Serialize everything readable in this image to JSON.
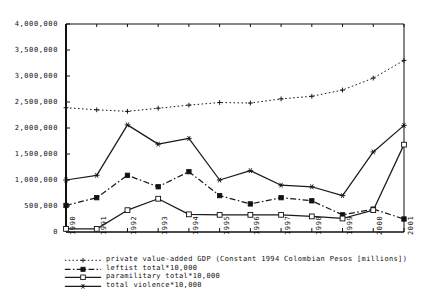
{
  "chart_data": {
    "type": "line",
    "title": "",
    "xlabel": "",
    "ylabel": "",
    "categories": [
      "1990",
      "1991",
      "1992",
      "1993",
      "1994",
      "1995",
      "1996",
      "1997",
      "1998",
      "1999",
      "2000",
      "2001"
    ],
    "ylim": [
      0,
      4000000
    ],
    "ytick_labels": [
      "0",
      "500,000",
      "1,000,000",
      "1,500,000",
      "2,000,000",
      "2,500,000",
      "3,000,000",
      "3,500,000",
      "4,000,000"
    ],
    "ytick_values": [
      0,
      500000,
      1000000,
      1500000,
      2000000,
      2500000,
      3000000,
      3500000,
      4000000
    ],
    "grid": false,
    "legend_position": "below",
    "series": [
      {
        "name": "private value-added GDP (Constant 1994 Colombian Pesos [millions])",
        "key": "gdp",
        "marker": "plus",
        "linestyle": "dotted",
        "color": "#1a1a1a",
        "values": [
          2390000,
          2350000,
          2320000,
          2380000,
          2440000,
          2490000,
          2480000,
          2560000,
          2610000,
          2730000,
          2960000,
          3300000
        ]
      },
      {
        "name": "leftist total*10,000",
        "key": "leftist",
        "marker": "filled-square",
        "linestyle": "dash-dot",
        "color": "#1a1a1a",
        "values": [
          510000,
          660000,
          1090000,
          870000,
          1160000,
          700000,
          540000,
          660000,
          600000,
          330000,
          440000,
          250000
        ]
      },
      {
        "name": "paramilitary total*10,000",
        "key": "paramilitary",
        "marker": "open-square",
        "linestyle": "solid",
        "color": "#1a1a1a",
        "values": [
          60000,
          60000,
          420000,
          640000,
          340000,
          330000,
          330000,
          330000,
          300000,
          260000,
          420000,
          1680000
        ]
      },
      {
        "name": "total violence*10,000",
        "key": "violence",
        "marker": "star",
        "linestyle": "solid",
        "color": "#1a1a1a",
        "values": [
          1000000,
          1090000,
          2060000,
          1690000,
          1800000,
          1000000,
          1180000,
          900000,
          870000,
          700000,
          1540000,
          2050000
        ]
      }
    ]
  },
  "axes": {
    "x_start": 66,
    "x_end": 404,
    "y_top": 24,
    "y_bottom": 232,
    "frame_color": "#111111"
  }
}
